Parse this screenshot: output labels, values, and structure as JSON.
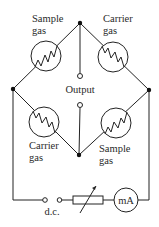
{
  "diagram": {
    "labels": {
      "top_left": [
        "Sample",
        "gas"
      ],
      "top_right": [
        "Carrier",
        "gas"
      ],
      "bottom_left": [
        "Carrier",
        "gas"
      ],
      "bottom_right": [
        "Sample",
        "gas"
      ],
      "output": "Output",
      "power": "d.c.",
      "meter": "mA"
    },
    "components": [
      {
        "id": "R1",
        "type": "filament-cell",
        "gas": "Sample gas",
        "position": "top-left"
      },
      {
        "id": "R2",
        "type": "filament-cell",
        "gas": "Carrier gas",
        "position": "top-right"
      },
      {
        "id": "R3",
        "type": "filament-cell",
        "gas": "Carrier gas",
        "position": "bottom-left"
      },
      {
        "id": "R4",
        "type": "filament-cell",
        "gas": "Sample gas",
        "position": "bottom-right"
      },
      {
        "id": "VR",
        "type": "variable-resistor",
        "position": "bottom-wire"
      },
      {
        "id": "M",
        "type": "milliammeter",
        "label": "mA"
      },
      {
        "id": "DC",
        "type": "dc-supply-terminals",
        "label": "d.c."
      },
      {
        "id": "OUT",
        "type": "output-terminals",
        "label": "Output"
      }
    ],
    "colors": {
      "line": "#222222",
      "background": "#ffffff"
    }
  }
}
